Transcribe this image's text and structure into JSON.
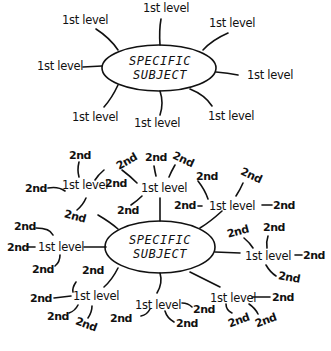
{
  "diagrams": [
    {
      "name": "first-level-map",
      "center": {
        "line1": "SPECIFIC",
        "line2": "SUBJECT"
      },
      "first_level": [
        {
          "label": "1st level"
        },
        {
          "label": "1st level"
        },
        {
          "label": "1st level"
        },
        {
          "label": "1st level"
        },
        {
          "label": "1st level"
        },
        {
          "label": "1st level"
        },
        {
          "label": "1st level"
        },
        {
          "label": "1st level"
        }
      ]
    },
    {
      "name": "second-level-map",
      "center": {
        "line1": "SPECIFIC",
        "line2": "SUBJECT"
      },
      "first_level": [
        {
          "label": "1st level",
          "children": [
            "2nd",
            "2nd",
            "2nd"
          ]
        },
        {
          "label": "1st level",
          "children": [
            "2nd",
            "2nd",
            "2nd",
            "2nd"
          ]
        },
        {
          "label": "1st level",
          "children": [
            "2nd",
            "2nd",
            "2nd",
            "2nd"
          ]
        },
        {
          "label": "1st level",
          "children": [
            "2nd",
            "2nd",
            "2nd"
          ]
        },
        {
          "label": "1st level",
          "children": [
            "2nd",
            "2nd",
            "2nd"
          ]
        },
        {
          "label": "1st level",
          "children": [
            "2nd",
            "2nd",
            "2nd",
            "2nd"
          ]
        },
        {
          "label": "1st level",
          "children": [
            "2nd",
            "2nd"
          ]
        },
        {
          "label": "1st level",
          "children": [
            "2nd",
            "2nd",
            "2nd"
          ]
        }
      ]
    }
  ]
}
